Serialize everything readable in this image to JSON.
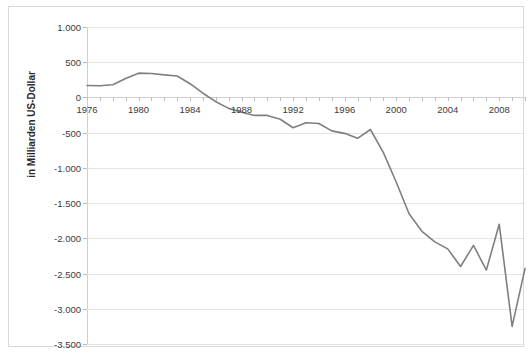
{
  "chart_data": {
    "type": "line",
    "title": "",
    "subtitle": "",
    "xlabel": "",
    "ylabel": "in Milliarden US-Dollar",
    "xlim": [
      1976,
      2010
    ],
    "ylim": [
      -3500,
      1000
    ],
    "grid": true,
    "legend_position": "none",
    "y_tick_step": 500,
    "x_tick_step": 1,
    "x_label_step": 4,
    "series_color": "#7f7f7f",
    "grid_color": "#e4e4e4",
    "axis_color": "#cfcfcf",
    "yticks": [
      1000,
      500,
      0,
      -500,
      -1000,
      -1500,
      -2000,
      -2500,
      -3000,
      -3500
    ],
    "ytick_labels": [
      "1.000",
      "500",
      "0",
      "-500",
      "-1.000",
      "-1.500",
      "-2.000",
      "-2.500",
      "-3.000",
      "-3.500"
    ],
    "xticks": [
      1976,
      1977,
      1978,
      1979,
      1980,
      1981,
      1982,
      1983,
      1984,
      1985,
      1986,
      1987,
      1988,
      1989,
      1990,
      1991,
      1992,
      1993,
      1994,
      1995,
      1996,
      1997,
      1998,
      1999,
      2000,
      2001,
      2002,
      2003,
      2004,
      2005,
      2006,
      2007,
      2008,
      2009,
      2010
    ],
    "xtick_labels": [
      "1976",
      "1980",
      "1984",
      "1988",
      "1992",
      "1996",
      "2000",
      "2004",
      "2008"
    ],
    "xtick_label_values": [
      1976,
      1980,
      1984,
      1988,
      1992,
      1996,
      2000,
      2004,
      2008
    ],
    "x": [
      1976,
      1977,
      1978,
      1979,
      1980,
      1981,
      1982,
      1983,
      1984,
      1985,
      1986,
      1987,
      1988,
      1989,
      1990,
      1991,
      1992,
      1993,
      1994,
      1995,
      1996,
      1997,
      1998,
      1999,
      2000,
      2001,
      2002,
      2003,
      2004,
      2005,
      2006,
      2007,
      2008,
      2009,
      2010
    ],
    "values": [
      170,
      165,
      180,
      270,
      345,
      340,
      320,
      305,
      195,
      60,
      -60,
      -155,
      -210,
      -255,
      -255,
      -310,
      -430,
      -360,
      -370,
      -475,
      -510,
      -580,
      -455,
      -780,
      -1200,
      -1650,
      -1900,
      -2050,
      -2150,
      -2400,
      -2100,
      -2450,
      -1800,
      -3250,
      -2430
    ],
    "series": [
      {
        "name": "Saldo",
        "values": [
          170,
          165,
          180,
          270,
          345,
          340,
          320,
          305,
          195,
          60,
          -60,
          -155,
          -210,
          -255,
          -255,
          -310,
          -430,
          -360,
          -370,
          -475,
          -510,
          -580,
          -455,
          -780,
          -1200,
          -1650,
          -1900,
          -2050,
          -2150,
          -2400,
          -2100,
          -2450,
          -1800,
          -3250,
          -2430
        ]
      }
    ]
  }
}
